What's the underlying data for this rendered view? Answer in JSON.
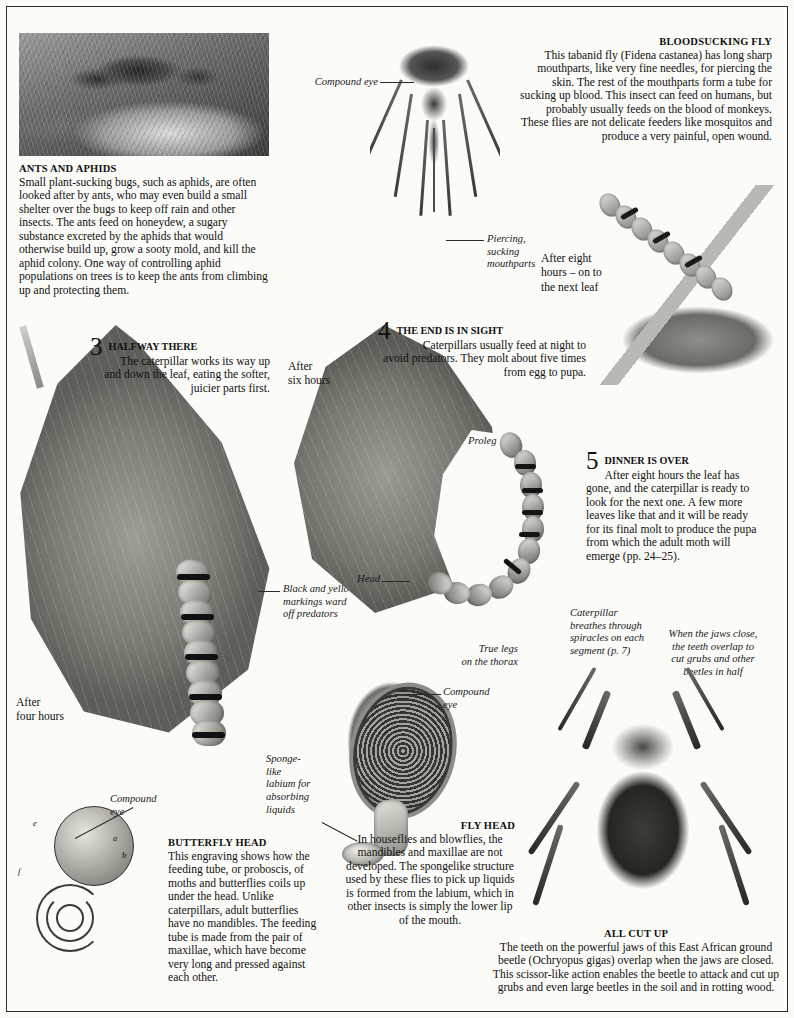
{
  "page": {
    "background_color": "#fbfbf8",
    "text_color": "#111111"
  },
  "sections": {
    "ants_and_aphids": {
      "heading": "ANTS AND APHIDS",
      "body": "Small plant-sucking bugs, such as aphids, are often looked after by ants, who may even build a small shelter over the bugs to keep off rain and other insects. The ants feed on honeydew, a sugary substance excreted by the aphids that would otherwise build up, grow a sooty mold, and kill the aphid colony. One way of controlling aphid populations on trees is to keep the ants from climbing up and protecting them.",
      "image_caption": "photograph of ants tending aphids on a plant stem"
    },
    "bloodsucking_fly": {
      "heading": "BLOODSUCKING FLY",
      "body": "This tabanid fly (Fidena castanea) has long sharp mouthparts, like very fine needles, for piercing the skin. The rest of the mouthparts form a tube for sucking up blood. This insect can feed on humans, but probably usually feeds on the blood of monkeys. These flies are not delicate feeders like mosquitos and produce a very painful, open wound.",
      "species_italic": "Fidena castanea",
      "labels": {
        "compound_eye": "Compound eye",
        "mouthparts": "Piercing,\nsucking\nmouthparts"
      }
    },
    "step3": {
      "number": "3",
      "heading": "HALFWAY THERE",
      "body": "The caterpillar works its way up and down the leaf, eating the softer, juicier parts first.",
      "time_label": "After\nfour hours",
      "annotation": "Black and yellow\nmarkings ward\noff predators"
    },
    "step4": {
      "number": "4",
      "heading": "THE END IS IN SIGHT",
      "body": "Caterpillars usually feed at night to avoid predators. They molt about five times from egg to pupa.",
      "time_label": "After\nsix hours",
      "labels": {
        "proleg": "Proleg",
        "head": "Head",
        "spiracles": "Caterpillar\nbreathes through\nspiracles on each\nsegment (p. 7)",
        "true_legs": "True legs\non the thorax"
      }
    },
    "step5": {
      "number": "5",
      "heading": "DINNER IS OVER",
      "body": "After eight hours the leaf has gone, and the caterpillar is ready to look for the next one. A few more leaves like that and it will be ready for its final molt to produce the pupa from which the adult moth will emerge (pp. 24–25).",
      "time_label": "After eight\nhours – on to\nthe next leaf"
    },
    "butterfly_head": {
      "heading": "BUTTERFLY HEAD",
      "body": "This engraving shows how the feeding tube, or proboscis, of moths and butterflies coils up under the head. Unlike caterpillars, adult butterflies have no mandibles. The feeding tube is made from the pair of maxillae, which have become very long and pressed against each other.",
      "labels": {
        "compound_eye": "Compound\neye",
        "marks": [
          "e",
          "a",
          "b",
          "f"
        ]
      }
    },
    "fly_head": {
      "heading": "FLY HEAD",
      "body": "In houseflies and blowflies, the mandibles and maxillae are not developed. The spongelike structure used by these flies to pick up liquids is formed from the labium, which in other insects is simply the lower lip of the mouth.",
      "labels": {
        "compound_eye": "Compound\neye",
        "labium": "Sponge-\nlike\nlabium for\nabsorbing\nliquids"
      }
    },
    "all_cut_up": {
      "heading": "ALL CUT UP",
      "body": "The teeth on the powerful jaws of this East African ground beetle (Ochryopus gigas) overlap when the jaws are closed. This scissor-like action enables the beetle to attack and cut up grubs and even large beetles in the soil and in rotting wood.",
      "species_italic": "Ochryopus gigas",
      "annotation": "When the jaws close,\nthe teeth overlap to\ncut grubs and other\nbeetles in half"
    }
  }
}
